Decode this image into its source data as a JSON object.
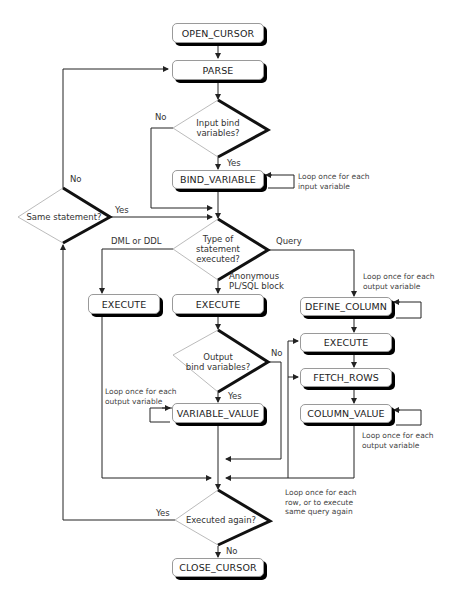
{
  "diagram": {
    "nodes": {
      "open_cursor": "OPEN_CURSOR",
      "parse": "PARSE",
      "bind_variable": "BIND_VARIABLE",
      "execute_dml": "EXECUTE",
      "execute_plsql": "EXECUTE",
      "define_column": "DEFINE_COLUMN",
      "execute_query": "EXECUTE",
      "fetch_rows": "FETCH_ROWS",
      "column_value": "COLUMN_VALUE",
      "variable_value": "VARIABLE_VALUE",
      "close_cursor": "CLOSE_CURSOR"
    },
    "decisions": {
      "input_bind": "Input bind\nvariables?",
      "same_statement": "Same statement?",
      "statement_type": "Type of\nstatement\nexecuted?",
      "output_bind": "Output\nbind variables?",
      "executed_again": "Executed again?"
    },
    "edge_labels": {
      "input_no": "No",
      "input_yes": "Yes",
      "same_no": "No",
      "same_yes": "Yes",
      "dml_ddl": "DML or DDL",
      "query": "Query",
      "anon_block": "Anonymous\nPL/SQL block",
      "output_no": "No",
      "output_yes": "Yes",
      "again_yes": "Yes",
      "again_no": "No"
    },
    "notes": {
      "bind_loop": "Loop once for each\ninput variable",
      "define_loop": "Loop once for each\noutput variable",
      "variable_loop": "Loop once for each\noutput variable",
      "column_loop": "Loop once for each\noutput variable",
      "row_loop": "Loop once for each\nrow, or to execute\nsame query again"
    }
  }
}
